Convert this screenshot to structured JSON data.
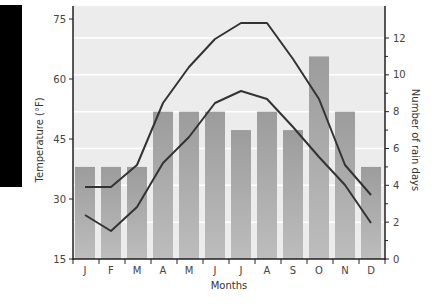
{
  "chart_data": {
    "type": "bar+line",
    "title": "",
    "xlabel": "Months",
    "ylabel": "Temperature (°F)",
    "y2label": "Number of rain days",
    "categories": [
      "J",
      "F",
      "M",
      "A",
      "M",
      "J",
      "J",
      "A",
      "S",
      "O",
      "N",
      "D"
    ],
    "ylim": [
      15,
      75
    ],
    "y2lim": [
      0,
      12
    ],
    "yticks": [
      15,
      30,
      45,
      60,
      75
    ],
    "y2ticks": [
      0,
      2,
      4,
      6,
      8,
      10,
      12
    ],
    "grid": true,
    "legend": null,
    "series": [
      {
        "name": "Rain days",
        "type": "bar",
        "axis": "right",
        "values": [
          5,
          5,
          5,
          8,
          8,
          8,
          7,
          8,
          7,
          11,
          8,
          5
        ]
      },
      {
        "name": "High temperature",
        "type": "line",
        "axis": "left",
        "values": [
          33,
          33,
          38.5,
          54,
          63,
          70,
          74,
          74,
          65,
          55,
          38.5,
          31
        ]
      },
      {
        "name": "Low temperature",
        "type": "line",
        "axis": "left",
        "values": [
          26,
          22,
          28,
          39,
          45.5,
          54,
          57,
          55,
          48,
          40.5,
          33.5,
          24
        ]
      }
    ]
  },
  "colors": {
    "background": "#ebebeb",
    "bar": "#a8a8a8",
    "bar_dark": "#999999",
    "line": "#333333",
    "grid": "#ffffff",
    "axis": "#222222"
  }
}
